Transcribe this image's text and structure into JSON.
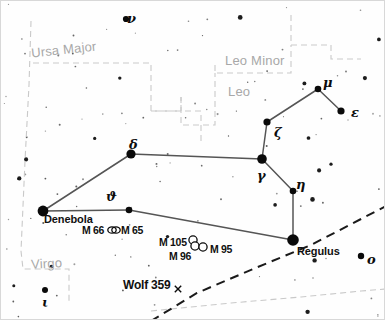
{
  "chart": {
    "width": 385,
    "height": 320,
    "background_color": "#fefefe",
    "star_color": "#0a0a0a",
    "line_color": "#555555",
    "boundary_color": "#c9c9c9",
    "ecliptic_color": "#1a1a1a"
  },
  "regions": [
    {
      "name": "Ursa Major",
      "x": 30,
      "y": 41,
      "rotate": -6
    },
    {
      "name": "Leo Minor",
      "x": 224,
      "y": 52,
      "rotate": 0
    },
    {
      "name": "Leo",
      "x": 227,
      "y": 83,
      "rotate": 0
    },
    {
      "name": "Virgo",
      "x": 30,
      "y": 255,
      "rotate": -3
    }
  ],
  "named_stars": [
    {
      "label": "Denebola",
      "x": 43,
      "y": 212,
      "cx": 42,
      "cy": 210,
      "r": 5.4
    },
    {
      "label": "Regulus",
      "x": 296,
      "y": 244,
      "cx": 292,
      "cy": 239,
      "r": 5.8
    }
  ],
  "bayer_stars": [
    {
      "label": "ν",
      "x": 126,
      "y": 10,
      "cx": 125,
      "cy": 18,
      "r": 3.1
    },
    {
      "label": "μ",
      "x": 322,
      "y": 74,
      "cx": 317,
      "cy": 88,
      "r": 3.3
    },
    {
      "label": "ε",
      "x": 350,
      "y": 104,
      "cx": 340,
      "cy": 110,
      "r": 3.6
    },
    {
      "label": "ζ",
      "x": 273,
      "y": 124,
      "cx": 266,
      "cy": 121,
      "r": 3.6
    },
    {
      "label": "δ",
      "x": 128,
      "y": 136,
      "cx": 130,
      "cy": 153,
      "r": 4.6
    },
    {
      "label": "γ",
      "x": 256,
      "y": 167,
      "cx": 261,
      "cy": 158,
      "r": 4.8
    },
    {
      "label": "η",
      "x": 295,
      "y": 176,
      "cx": 292,
      "cy": 190,
      "r": 3.3
    },
    {
      "label": "ϑ",
      "x": 105,
      "y": 188,
      "cx": 128,
      "cy": 209,
      "r": 3.3
    },
    {
      "label": "o",
      "x": 366,
      "y": 251,
      "cx": 360,
      "cy": 255,
      "r": 3.2
    },
    {
      "label": "ι",
      "x": 41,
      "y": 294,
      "cx": 44,
      "cy": 289,
      "r": 3.0
    }
  ],
  "messier_objects": [
    {
      "label": "M 66",
      "label_x": 81,
      "label_y": 223,
      "cx": 111,
      "cy": 229,
      "symbol": "galaxy"
    },
    {
      "label": "M 65",
      "label_x": 120,
      "label_y": 223,
      "cx": 115,
      "cy": 229,
      "symbol": "galaxy"
    },
    {
      "label": "M 105",
      "label_x": 158,
      "label_y": 235,
      "cx": 192,
      "cy": 239,
      "symbol": "open"
    },
    {
      "label": "M 96",
      "label_x": 168,
      "label_y": 249,
      "cx": 194,
      "cy": 245,
      "symbol": "open"
    },
    {
      "label": "M 95",
      "label_x": 209,
      "label_y": 242,
      "cx": 202,
      "cy": 246,
      "symbol": "open"
    }
  ],
  "special_objects": [
    {
      "label": "Wolf 359",
      "label_x": 122,
      "label_y": 277,
      "marker_x": 177,
      "marker_y": 288,
      "symbol": "cross"
    }
  ],
  "constellation_lines": [
    {
      "from": "Denebola",
      "to": "delta",
      "x1": 42,
      "y1": 210,
      "x2": 130,
      "y2": 153
    },
    {
      "from": "delta",
      "to": "gamma",
      "x1": 130,
      "y1": 153,
      "x2": 261,
      "y2": 158
    },
    {
      "from": "gamma",
      "to": "zeta",
      "x1": 261,
      "y1": 158,
      "x2": 266,
      "y2": 121
    },
    {
      "from": "zeta",
      "to": "mu",
      "x1": 266,
      "y1": 121,
      "x2": 317,
      "y2": 88
    },
    {
      "from": "mu",
      "to": "epsilon",
      "x1": 317,
      "y1": 88,
      "x2": 340,
      "y2": 110
    },
    {
      "from": "gamma",
      "to": "eta",
      "x1": 261,
      "y1": 158,
      "x2": 292,
      "y2": 190
    },
    {
      "from": "eta",
      "to": "Regulus",
      "x1": 292,
      "y1": 190,
      "x2": 292,
      "y2": 239
    },
    {
      "from": "Denebola",
      "to": "theta",
      "x1": 42,
      "y1": 210,
      "x2": 128,
      "y2": 209
    },
    {
      "from": "theta",
      "to": "Regulus",
      "x1": 128,
      "y1": 209,
      "x2": 292,
      "y2": 239
    }
  ],
  "ecliptic": {
    "name": "ecliptic",
    "points": "150,320 196,292 252,268 310,244 360,218 385,205"
  },
  "boundaries": [
    {
      "name": "ursa-major-virgo-west",
      "points": "30,20 28,84 24,160 20,250 22,268 68,268 68,300"
    },
    {
      "name": "ursa-major-south",
      "points": "32,62 150,62 150,110 200,110 200,140"
    },
    {
      "name": "leo-minor-north",
      "points": "290,14 290,44 330,44 330,58 360,58"
    },
    {
      "name": "leo-minor-south",
      "points": "214,64 214,72 290,72 290,44"
    },
    {
      "name": "leo-north",
      "points": "180,96 180,124 214,124 214,72"
    },
    {
      "name": "leo-west-step",
      "points": "150,110 180,110 180,96"
    },
    {
      "name": "south-boundary",
      "points": "150,310 230,302 300,296 360,290 385,288"
    }
  ],
  "background_star_counts": {
    "faint": 96,
    "medium": 18
  }
}
